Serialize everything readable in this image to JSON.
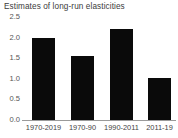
{
  "chart_data": {
    "type": "bar",
    "title": "Estimates of long-run elasticities",
    "xlabel": "",
    "ylabel": "",
    "categories": [
      "1970-2019",
      "1970-90",
      "1990-2011",
      "2011-19"
    ],
    "values": [
      2.0,
      1.55,
      2.2,
      1.03
    ],
    "ylim": [
      0.0,
      2.5
    ],
    "yticks": [
      "0.0",
      "0.5",
      "1.0",
      "1.5",
      "2.0",
      "2.5"
    ],
    "ytick_values": [
      0.0,
      0.5,
      1.0,
      1.5,
      2.0,
      2.5
    ],
    "grid": false,
    "legend": "none",
    "bar_color": "#0a0a0a",
    "background_color": "#ffffff",
    "axis_color": "#9a9a9a",
    "title_color": "#3b3b3b"
  }
}
